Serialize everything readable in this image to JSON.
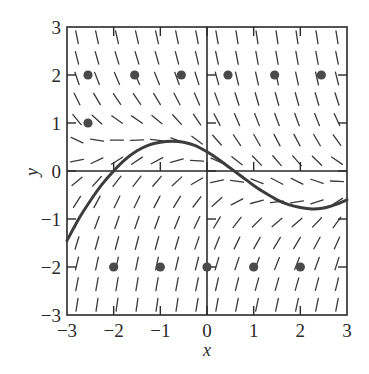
{
  "chart_data": {
    "type": "slope-field",
    "title": "",
    "xlabel": "x",
    "ylabel": "y",
    "xlim": [
      -3,
      3
    ],
    "ylim": [
      -3,
      3
    ],
    "xticks": [
      -3,
      -2,
      -1,
      0,
      1,
      2,
      3
    ],
    "yticks": [
      -3,
      -2,
      -1,
      0,
      1,
      2,
      3
    ],
    "xtick_labels": [
      "−3",
      "−2",
      "−1",
      "0",
      "1",
      "2",
      "3"
    ],
    "ytick_labels": [
      "−3",
      "−2",
      "−1",
      "0",
      "1",
      "2",
      "3"
    ],
    "grid": false,
    "legend": null,
    "slope_field": {
      "columns": 14,
      "rows": 14,
      "description": "Short line segments; steep negative slopes for y > 1, steep positive slopes for y < -1, near-horizontal segments along a band that drifts from about y = 0.6 at left to y = -0.8 at right"
    },
    "solution_curve": {
      "points": [
        [
          -3.0,
          -1.45
        ],
        [
          -2.75,
          -1.0
        ],
        [
          -2.5,
          -0.62
        ],
        [
          -2.25,
          -0.28
        ],
        [
          -2.0,
          0.0
        ],
        [
          -1.75,
          0.24
        ],
        [
          -1.5,
          0.42
        ],
        [
          -1.25,
          0.54
        ],
        [
          -1.0,
          0.6
        ],
        [
          -0.75,
          0.62
        ],
        [
          -0.5,
          0.6
        ],
        [
          -0.25,
          0.53
        ],
        [
          0.0,
          0.4
        ],
        [
          0.25,
          0.24
        ],
        [
          0.5,
          0.06
        ],
        [
          0.75,
          -0.12
        ],
        [
          1.0,
          -0.3
        ],
        [
          1.25,
          -0.46
        ],
        [
          1.5,
          -0.6
        ],
        [
          1.75,
          -0.7
        ],
        [
          2.0,
          -0.76
        ],
        [
          2.25,
          -0.79
        ],
        [
          2.5,
          -0.77
        ],
        [
          2.75,
          -0.7
        ],
        [
          3.0,
          -0.6
        ]
      ]
    },
    "marked_points": [
      [
        -2.55,
        2
      ],
      [
        -1.55,
        2
      ],
      [
        -0.55,
        2
      ],
      [
        0.45,
        2
      ],
      [
        1.45,
        2
      ],
      [
        2.45,
        2
      ],
      [
        -2.55,
        1
      ],
      [
        -2,
        -2
      ],
      [
        -1,
        -2
      ],
      [
        0,
        -2
      ],
      [
        1,
        -2
      ],
      [
        2,
        -2
      ]
    ]
  },
  "colors": {
    "axis": "#2a2a2a",
    "segments": "#3a3a3a",
    "curve": "#3c3c3c",
    "points": "#4a4a4a"
  }
}
